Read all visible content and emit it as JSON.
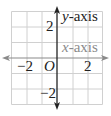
{
  "diagram": {
    "type": "coordinate-plane",
    "grid": {
      "columns": 6,
      "rows": 6,
      "x_range": [
        -3,
        3
      ],
      "y_range": [
        -3,
        3
      ],
      "line_color": "#d0d0d0"
    },
    "x_axis": {
      "label_var": "x",
      "label_suffix": "-axis",
      "color": "#8a8a8a",
      "arrows": "both"
    },
    "y_axis": {
      "label_var": "y",
      "label_suffix": "-axis",
      "color": "#222222",
      "arrows": "both"
    },
    "origin_label": "O",
    "ticks": {
      "x_neg": "−2",
      "x_pos": "2",
      "y_pos": "2",
      "y_neg": "−2"
    }
  }
}
